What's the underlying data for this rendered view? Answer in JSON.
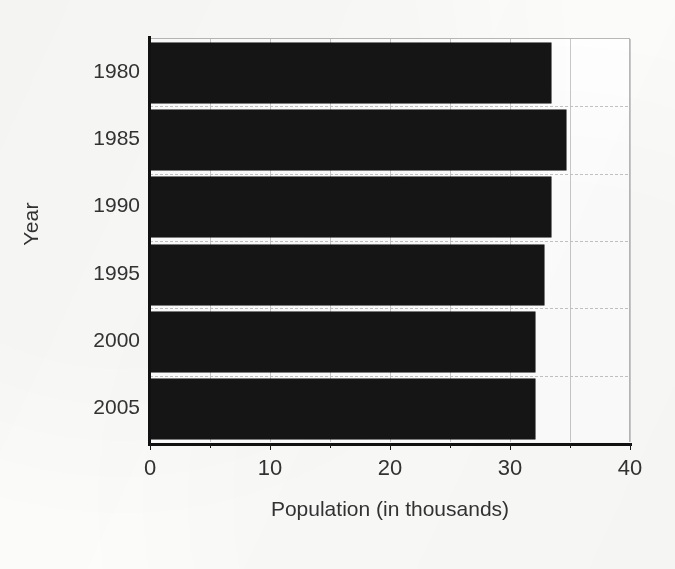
{
  "chart_data": {
    "type": "bar",
    "orientation": "horizontal",
    "title": "",
    "xlabel": "Population (in thousands)",
    "ylabel": "Year",
    "categories": [
      "1980",
      "1985",
      "1990",
      "1995",
      "2000",
      "2005"
    ],
    "values": [
      33.4,
      34.7,
      33.4,
      32.8,
      32.1,
      32.1
    ],
    "series": [
      {
        "name": "Population",
        "values": [
          33.4,
          34.7,
          33.4,
          32.8,
          32.1,
          32.1
        ]
      }
    ],
    "xlim": [
      0,
      40
    ],
    "xticks": [
      0,
      10,
      20,
      30,
      40
    ],
    "xticklabels": [
      "0",
      "10",
      "20",
      "30",
      "40"
    ],
    "x_minor_ticks": [
      5,
      15,
      25,
      35
    ],
    "yticklabels": [
      "1980",
      "1985",
      "1990",
      "1995",
      "2000",
      "2005"
    ],
    "grid": "both",
    "legend": "none",
    "bar_color": "#151515",
    "background_color": "#ffffff",
    "grid_color": "#c9c9c9",
    "axis_color": "#111111"
  },
  "axis": {
    "x_title": "Population (in thousands)",
    "y_title": "Year"
  }
}
